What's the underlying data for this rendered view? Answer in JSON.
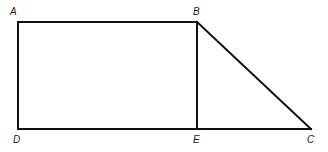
{
  "diagram": {
    "type": "geometry-figure",
    "points": {
      "A": {
        "label": "A",
        "x": 18,
        "y": 22
      },
      "B": {
        "label": "B",
        "x": 197,
        "y": 22
      },
      "C": {
        "label": "C",
        "x": 311,
        "y": 129
      },
      "D": {
        "label": "D",
        "x": 18,
        "y": 129
      },
      "E": {
        "label": "E",
        "x": 197,
        "y": 129
      }
    },
    "segments": [
      "AB",
      "AD",
      "DE",
      "EC",
      "BE",
      "BC"
    ],
    "line_color": "#111111",
    "background": "#ffffff"
  }
}
